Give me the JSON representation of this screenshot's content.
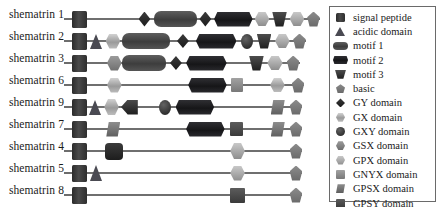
{
  "figure": {
    "background": "#ffffff",
    "backbone_color": "#6f6f6f"
  },
  "legend": {
    "border_color": "#6a6a6a",
    "items": [
      {
        "label": "signal peptide",
        "shape": "signal",
        "color": "#2e2e2e",
        "icon": "square-icon"
      },
      {
        "label": "acidic domain",
        "shape": "acidic",
        "color": "#4a4a52",
        "icon": "triangle-icon"
      },
      {
        "label": "motif 1",
        "shape": "motif1",
        "color": "#4a4a4a",
        "icon": "capsule-icon"
      },
      {
        "label": "motif 2",
        "shape": "motif2",
        "color": "#1b1b1d",
        "icon": "hexagon-capsule-icon"
      },
      {
        "label": "motif 3",
        "shape": "motif3",
        "color": "#2b2b2b",
        "icon": "trapezoid-icon"
      },
      {
        "label": "basic",
        "shape": "basic",
        "color": "#7a7a7a",
        "icon": "pentagon-icon"
      },
      {
        "label": "GY domain",
        "shape": "gy",
        "color": "#262626",
        "icon": "diamond-icon"
      },
      {
        "label": "GX domain",
        "shape": "gx",
        "color": "#b4b4b4",
        "icon": "hexagon-icon"
      },
      {
        "label": "GXY domain",
        "shape": "gxy",
        "color": "#3b3b3b",
        "icon": "circle-icon"
      },
      {
        "label": "GSX domain",
        "shape": "gsx",
        "color": "#7e7e7e",
        "icon": "hexagon-icon"
      },
      {
        "label": "GPX domain",
        "shape": "gpx",
        "color": "#b0b0b0",
        "icon": "hexagon-icon"
      },
      {
        "label": "GNYX domain",
        "shape": "gnyx",
        "color": "#8c8c8c",
        "icon": "square-icon"
      },
      {
        "label": "GPSX domain",
        "shape": "gpsx",
        "color": "#6e6e6e",
        "icon": "parallelogram-icon"
      },
      {
        "label": "GPSY domain",
        "shape": "gpsy",
        "color": "#4a4a4a",
        "icon": "square-icon"
      }
    ]
  },
  "chart_data": {
    "type": "diagram",
    "rows": [
      {
        "label": "shematrin 1",
        "track_width": 253,
        "elements": [
          {
            "shape": "signal",
            "name": "signal peptide",
            "x": 0,
            "w": 22,
            "h": 17
          },
          {
            "shape": "gy",
            "name": "GY domain",
            "x": 95,
            "w": 17,
            "h": 15
          },
          {
            "shape": "motif1",
            "name": "motif 1",
            "x": 117,
            "w": 62,
            "h": 16
          },
          {
            "shape": "gy",
            "name": "GY domain",
            "x": 182,
            "w": 17,
            "h": 15
          },
          {
            "shape": "motif2",
            "name": "motif 2",
            "x": 203,
            "w": 55,
            "h": 15
          },
          {
            "shape": "gpx",
            "name": "GPX domain",
            "x": 261,
            "w": 21,
            "h": 14
          },
          {
            "shape": "motif3",
            "name": "motif 3",
            "x": 286,
            "w": 21,
            "h": 15
          },
          {
            "shape": "gpx",
            "name": "GPX domain",
            "x": 311,
            "w": 21,
            "h": 14
          },
          {
            "shape": "basic",
            "name": "basic",
            "x": 336,
            "w": 18,
            "h": 15
          }
        ]
      },
      {
        "label": "shematrin 2",
        "track_width": 253,
        "elements": [
          {
            "shape": "signal",
            "name": "signal peptide",
            "x": 0,
            "w": 22,
            "h": 17
          },
          {
            "shape": "acidic",
            "name": "acidic domain",
            "x": 25,
            "w": 18,
            "h": 15
          },
          {
            "shape": "gx",
            "name": "GX domain",
            "x": 48,
            "w": 21,
            "h": 15
          },
          {
            "shape": "motif1",
            "name": "motif 1",
            "x": 72,
            "w": 68,
            "h": 16
          },
          {
            "shape": "gy",
            "name": "GY domain",
            "x": 150,
            "w": 17,
            "h": 14
          },
          {
            "shape": "motif2",
            "name": "motif 2",
            "x": 177,
            "w": 58,
            "h": 15
          },
          {
            "shape": "gxy",
            "name": "GXY domain",
            "x": 241,
            "w": 17,
            "h": 15
          },
          {
            "shape": "motif3",
            "name": "motif 3",
            "x": 264,
            "w": 21,
            "h": 15
          },
          {
            "shape": "gpx",
            "name": "GPX domain",
            "x": 290,
            "w": 21,
            "h": 14
          },
          {
            "shape": "basic",
            "name": "basic",
            "x": 316,
            "w": 18,
            "h": 15
          }
        ]
      },
      {
        "label": "shematrin 3",
        "track_width": 253,
        "elements": [
          {
            "shape": "signal",
            "name": "signal peptide",
            "x": 0,
            "w": 22,
            "h": 17
          },
          {
            "shape": "gsx",
            "name": "GSX domain",
            "x": 50,
            "w": 21,
            "h": 15
          },
          {
            "shape": "motif1",
            "name": "motif 1",
            "x": 72,
            "w": 62,
            "h": 16
          },
          {
            "shape": "gy",
            "name": "GY domain",
            "x": 140,
            "w": 17,
            "h": 14
          },
          {
            "shape": "motif2",
            "name": "motif 2",
            "x": 163,
            "w": 58,
            "h": 15
          },
          {
            "shape": "motif3",
            "name": "motif 3",
            "x": 253,
            "w": 21,
            "h": 15
          },
          {
            "shape": "gpx",
            "name": "GPX domain",
            "x": 279,
            "w": 22,
            "h": 14
          },
          {
            "shape": "basic",
            "name": "basic",
            "x": 307,
            "w": 18,
            "h": 15
          }
        ]
      },
      {
        "label": "shematrin 6",
        "track_width": 253,
        "elements": [
          {
            "shape": "signal",
            "name": "signal peptide",
            "x": 0,
            "w": 22,
            "h": 17
          },
          {
            "shape": "gx",
            "name": "GX domain",
            "x": 50,
            "w": 21,
            "h": 15
          },
          {
            "shape": "motif2",
            "name": "motif 2",
            "x": 166,
            "w": 55,
            "h": 15
          },
          {
            "shape": "gnyx",
            "name": "GNYX domain",
            "x": 227,
            "w": 17,
            "h": 14
          },
          {
            "shape": "gx",
            "name": "GX domain",
            "x": 283,
            "w": 21,
            "h": 14
          },
          {
            "shape": "basic",
            "name": "basic",
            "x": 314,
            "w": 18,
            "h": 15
          }
        ]
      },
      {
        "label": "shematrin 9",
        "track_width": 253,
        "elements": [
          {
            "shape": "signal",
            "name": "signal peptide",
            "x": 0,
            "w": 22,
            "h": 17
          },
          {
            "shape": "acidic",
            "name": "acidic domain",
            "x": 24,
            "w": 18,
            "h": 15
          },
          {
            "shape": "gx",
            "name": "GX domain",
            "x": 46,
            "w": 21,
            "h": 16
          },
          {
            "shape": "motif3rev",
            "name": "motif 3",
            "x": 70,
            "w": 24,
            "h": 15
          },
          {
            "shape": "gxy",
            "name": "GXY domain",
            "x": 124,
            "w": 17,
            "h": 15
          },
          {
            "shape": "motif2",
            "name": "motif 2",
            "x": 148,
            "w": 55,
            "h": 15
          },
          {
            "shape": "gpsx",
            "name": "GPSX domain",
            "x": 284,
            "w": 20,
            "h": 15
          },
          {
            "shape": "basic",
            "name": "basic",
            "x": 311,
            "w": 18,
            "h": 15
          }
        ]
      },
      {
        "label": "shematrin 7",
        "track_width": 253,
        "elements": [
          {
            "shape": "signal",
            "name": "signal peptide",
            "x": 0,
            "w": 22,
            "h": 17
          },
          {
            "shape": "gpsx",
            "name": "GPSX domain",
            "x": 49,
            "w": 20,
            "h": 15
          },
          {
            "shape": "motif2",
            "name": "motif 2",
            "x": 163,
            "w": 55,
            "h": 15
          },
          {
            "shape": "gpsy",
            "name": "GPSY domain",
            "x": 225,
            "w": 19,
            "h": 14
          },
          {
            "shape": "gpsx",
            "name": "GPSX domain",
            "x": 284,
            "w": 20,
            "h": 15
          },
          {
            "shape": "basic",
            "name": "basic",
            "x": 311,
            "w": 18,
            "h": 15
          }
        ]
      },
      {
        "label": "shematrin 4",
        "track_width": 253,
        "elements": [
          {
            "shape": "signal",
            "name": "signal peptide",
            "x": 0,
            "w": 22,
            "h": 17
          },
          {
            "shape": "dark-box",
            "name": "motif 2",
            "x": 47,
            "w": 26,
            "h": 17
          },
          {
            "shape": "gpx",
            "name": "GPX domain",
            "x": 226,
            "w": 21,
            "h": 16
          },
          {
            "shape": "basic",
            "name": "basic",
            "x": 311,
            "w": 18,
            "h": 15
          }
        ]
      },
      {
        "label": "shematrin 5",
        "track_width": 253,
        "elements": [
          {
            "shape": "signal",
            "name": "signal peptide",
            "x": 0,
            "w": 22,
            "h": 17
          },
          {
            "shape": "acidic",
            "name": "acidic domain",
            "x": 25,
            "w": 19,
            "h": 16
          },
          {
            "shape": "gpx",
            "name": "GPX domain",
            "x": 226,
            "w": 21,
            "h": 15
          },
          {
            "shape": "basic",
            "name": "basic",
            "x": 311,
            "w": 18,
            "h": 15
          }
        ]
      },
      {
        "label": "shematrin 8",
        "track_width": 253,
        "elements": [
          {
            "shape": "signal",
            "name": "signal peptide",
            "x": 0,
            "w": 22,
            "h": 17
          },
          {
            "shape": "gpsy",
            "name": "GPSY domain",
            "x": 226,
            "w": 21,
            "h": 15
          },
          {
            "shape": "basic",
            "name": "basic",
            "x": 311,
            "w": 18,
            "h": 15
          }
        ]
      }
    ]
  }
}
